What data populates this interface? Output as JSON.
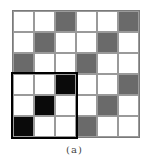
{
  "figure": {
    "caption": "(a)",
    "rows": 6,
    "cols": 6,
    "colors": {
      "white": "#ffffff",
      "gray": "#6a6a6a",
      "black": "#0a0a0a"
    },
    "cells": [
      [
        "W",
        "W",
        "G",
        "W",
        "W",
        "G"
      ],
      [
        "W",
        "G",
        "W",
        "W",
        "G",
        "W"
      ],
      [
        "G",
        "W",
        "W",
        "G",
        "W",
        "W"
      ],
      [
        "W",
        "W",
        "B",
        "W",
        "W",
        "G"
      ],
      [
        "W",
        "B",
        "W",
        "W",
        "G",
        "W"
      ],
      [
        "B",
        "W",
        "W",
        "G",
        "W",
        "W"
      ]
    ],
    "highlight": {
      "row_start": 3,
      "row_end": 5,
      "col_start": 0,
      "col_end": 2
    }
  }
}
